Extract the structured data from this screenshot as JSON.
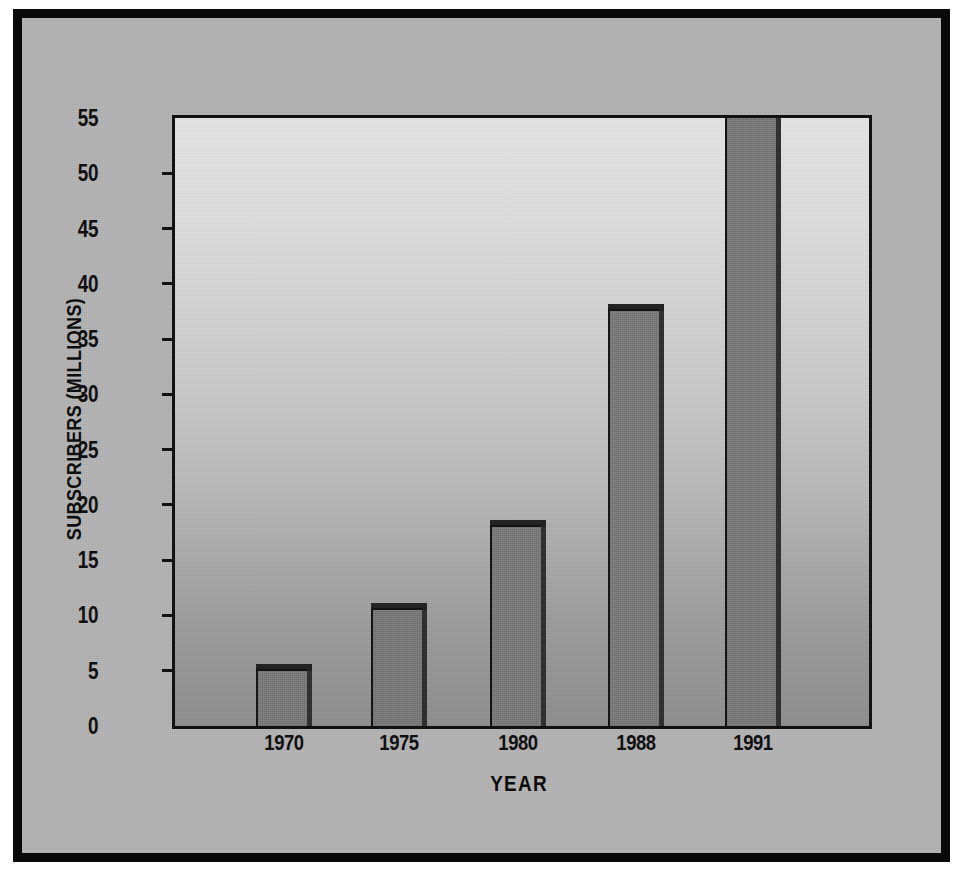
{
  "chart_data": {
    "type": "bar",
    "title": "",
    "xlabel": "YEAR",
    "ylabel": "SUBSCRIBERS (MILLIONS)",
    "categories": [
      "1970",
      "1975",
      "1980",
      "1988",
      "1991"
    ],
    "values": [
      5,
      10.5,
      18,
      37.5,
      55
    ],
    "value_notes": [
      "1970: 5 million",
      "1975: 10.5 million",
      "1980: 18 million",
      "1988: 37.5 million",
      "1991: bar extends above the top of the axis (exceeds 55 million)"
    ],
    "ylim": [
      0,
      55
    ],
    "ytick_values": [
      0,
      5,
      10,
      15,
      20,
      25,
      30,
      35,
      40,
      45,
      50,
      55
    ],
    "ytick_labels": [
      "0",
      "5",
      "10",
      "15",
      "20",
      "25",
      "30",
      "35",
      "40",
      "45",
      "50",
      "55"
    ],
    "grid": false,
    "legend": null,
    "series": [
      {
        "name": "Subscribers",
        "values": [
          5,
          10.5,
          18,
          37.5,
          55
        ]
      }
    ]
  },
  "colors": {
    "frame": "#0a0a0a",
    "figure_background": "#b4b4b4",
    "plot_background_top": "#e6e6e6",
    "plot_background_bottom": "#8e8e8e",
    "bar_face": "#787878",
    "bar_shadow": "#2b2b2b",
    "text": "#101010"
  },
  "axis": {
    "y_title": "SUBSCRIBERS (MILLIONS)",
    "x_title": "YEAR"
  },
  "ticks": {
    "y": [
      {
        "label": "55",
        "value": 55
      },
      {
        "label": "50",
        "value": 50
      },
      {
        "label": "45",
        "value": 45
      },
      {
        "label": "40",
        "value": 40
      },
      {
        "label": "35",
        "value": 35
      },
      {
        "label": "30",
        "value": 30
      },
      {
        "label": "25",
        "value": 25
      },
      {
        "label": "20",
        "value": 20
      },
      {
        "label": "15",
        "value": 15
      },
      {
        "label": "10",
        "value": 10
      },
      {
        "label": "5",
        "value": 5
      },
      {
        "label": "0",
        "value": 0
      }
    ],
    "x": [
      {
        "label": "1970"
      },
      {
        "label": "1975"
      },
      {
        "label": "1980"
      },
      {
        "label": "1988"
      },
      {
        "label": "1991"
      }
    ]
  }
}
